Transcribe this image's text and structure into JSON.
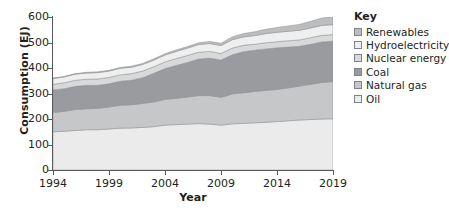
{
  "chart_data": {
    "type": "area",
    "stacked": true,
    "title": "",
    "xlabel": "Year",
    "ylabel": "Consumption (EJ)",
    "xlim": [
      1994,
      2019
    ],
    "ylim": [
      0,
      600
    ],
    "xticks": [
      1994,
      1999,
      2004,
      2009,
      2014,
      2019
    ],
    "yticks": [
      0,
      100,
      200,
      300,
      400,
      500,
      600
    ],
    "grid": false,
    "legend_position": "right",
    "legend_title": "Key",
    "x": [
      1994,
      1995,
      1996,
      1997,
      1998,
      1999,
      2000,
      2001,
      2002,
      2003,
      2004,
      2005,
      2006,
      2007,
      2008,
      2009,
      2010,
      2011,
      2012,
      2013,
      2014,
      2015,
      2016,
      2017,
      2018,
      2019
    ],
    "series": [
      {
        "name": "Oil",
        "color": "#ebebeb",
        "values": [
          150,
          152,
          155,
          158,
          158,
          161,
          164,
          165,
          167,
          170,
          176,
          178,
          180,
          182,
          180,
          176,
          181,
          183,
          185,
          187,
          190,
          193,
          196,
          198,
          200,
          201
        ]
      },
      {
        "name": "Natural gas",
        "color": "#c6c7c9",
        "values": [
          76,
          78,
          82,
          82,
          84,
          86,
          90,
          91,
          94,
          97,
          101,
          103,
          106,
          110,
          112,
          109,
          117,
          120,
          123,
          125,
          126,
          129,
          133,
          138,
          143,
          146
        ]
      },
      {
        "name": "Coal",
        "color": "#9a9b9e",
        "values": [
          88,
          89,
          91,
          92,
          90,
          91,
          94,
          96,
          101,
          112,
          121,
          129,
          136,
          143,
          147,
          146,
          154,
          161,
          162,
          163,
          163,
          160,
          156,
          157,
          159,
          158
        ]
      },
      {
        "name": "Nuclear energy",
        "color": "#d8d9da",
        "values": [
          22,
          23,
          24,
          24,
          25,
          25,
          25,
          26,
          26,
          26,
          26,
          27,
          27,
          27,
          26,
          26,
          26,
          25,
          23,
          24,
          24,
          25,
          25,
          26,
          26,
          26
        ]
      },
      {
        "name": "Hydroelectricity",
        "color": "#efefef",
        "values": [
          23,
          23,
          24,
          24,
          25,
          25,
          26,
          25,
          26,
          26,
          27,
          28,
          29,
          30,
          31,
          31,
          33,
          33,
          34,
          36,
          37,
          37,
          38,
          38,
          39,
          39
        ]
      },
      {
        "name": "Renewables",
        "color": "#bcbdbf",
        "values": [
          2,
          2,
          2,
          3,
          3,
          3,
          3,
          4,
          4,
          5,
          5,
          6,
          6,
          7,
          8,
          9,
          11,
          13,
          15,
          17,
          19,
          21,
          23,
          26,
          29,
          32
        ]
      }
    ]
  },
  "legend": {
    "title": "Key",
    "items": [
      {
        "label": "Renewables",
        "swatch": "#bcbdbf"
      },
      {
        "label": "Hydroelectricity",
        "swatch": "#efefef"
      },
      {
        "label": "Nuclear energy",
        "swatch": "#d8d9da"
      },
      {
        "label": "Coal",
        "swatch": "#9a9b9e"
      },
      {
        "label": "Natural gas",
        "swatch": "#c6c7c9"
      },
      {
        "label": "Oil",
        "swatch": "#ebebeb"
      }
    ]
  }
}
